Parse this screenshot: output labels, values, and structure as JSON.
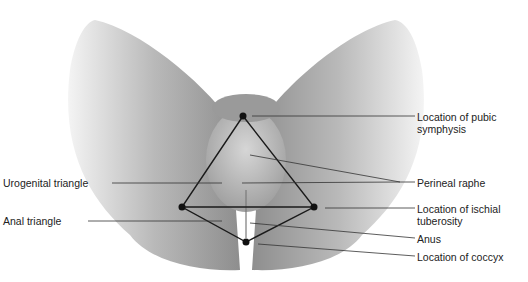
{
  "figure": {
    "type": "anatomical-landmark-diagram",
    "overlay_color": "#1a1a1a",
    "points": {
      "pubic_symphysis": [
        243,
        116
      ],
      "left_ischial_tuberosity": [
        182,
        207
      ],
      "right_ischial_tuberosity": [
        314,
        207
      ],
      "coccyx": [
        246,
        242
      ]
    },
    "regions": {
      "urogenital": "Urogenital triangle",
      "anal": "Anal triangle"
    }
  },
  "labels": {
    "left": [
      {
        "id": "urogenital_triangle",
        "text": "Urogenital triangle"
      },
      {
        "id": "anal_triangle",
        "text": "Anal triangle"
      }
    ],
    "right": [
      {
        "id": "pubic_symphysis",
        "text": "Location of pubic symphysis",
        "line1": "Location of pubic",
        "line2": "symphysis"
      },
      {
        "id": "perineal_raphe",
        "text": "Perineal raphe"
      },
      {
        "id": "ischial_tuberosity",
        "text": "Location of ischial tuberosity",
        "line1": "Location of ischial",
        "line2": "tuberosity"
      },
      {
        "id": "anus",
        "text": "Anus"
      },
      {
        "id": "coccyx",
        "text": "Location of coccyx"
      }
    ]
  }
}
